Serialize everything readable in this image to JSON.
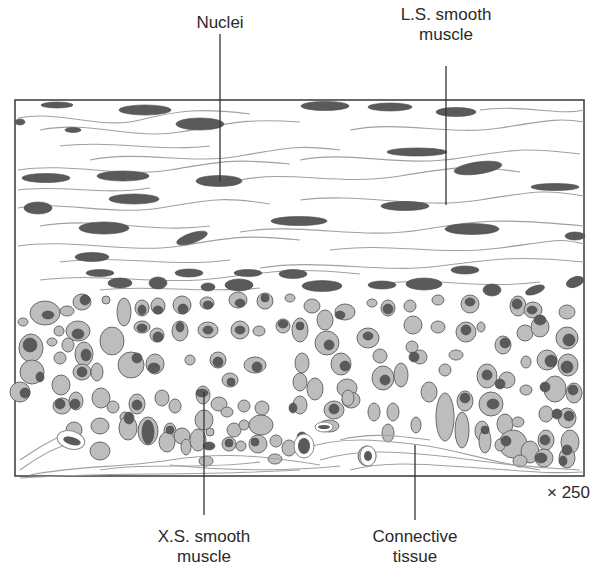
{
  "figure": {
    "type": "histology-diagram",
    "magnification": "× 250",
    "labels": [
      {
        "id": "nuclei",
        "lines": [
          "Nuclei"
        ],
        "x": 220,
        "y": 14,
        "line": [
          220,
          33,
          220,
          182
        ]
      },
      {
        "id": "ls-smooth-muscle",
        "lines": [
          "L.S. smooth",
          "muscle"
        ],
        "x": 446,
        "y": 4,
        "line": [
          446,
          65,
          446,
          204
        ]
      },
      {
        "id": "xs-smooth-muscle",
        "lines": [
          "X.S. smooth",
          "muscle"
        ],
        "x": 204,
        "y": 527,
        "line": [
          204,
          392,
          204,
          515
        ]
      },
      {
        "id": "connective-tissue",
        "lines": [
          "Connective",
          "tissue"
        ],
        "x": 415,
        "y": 527,
        "line": [
          415,
          445,
          415,
          520
        ]
      }
    ],
    "colors": {
      "border": "#444444",
      "nucleus": "#5a5a5a",
      "cell_fill": "#bdbdbd",
      "cell_stroke": "#6a6a6a",
      "fiber": "#9a9a9a",
      "label_text": "#2a2a2a",
      "background": "#ffffff"
    }
  }
}
